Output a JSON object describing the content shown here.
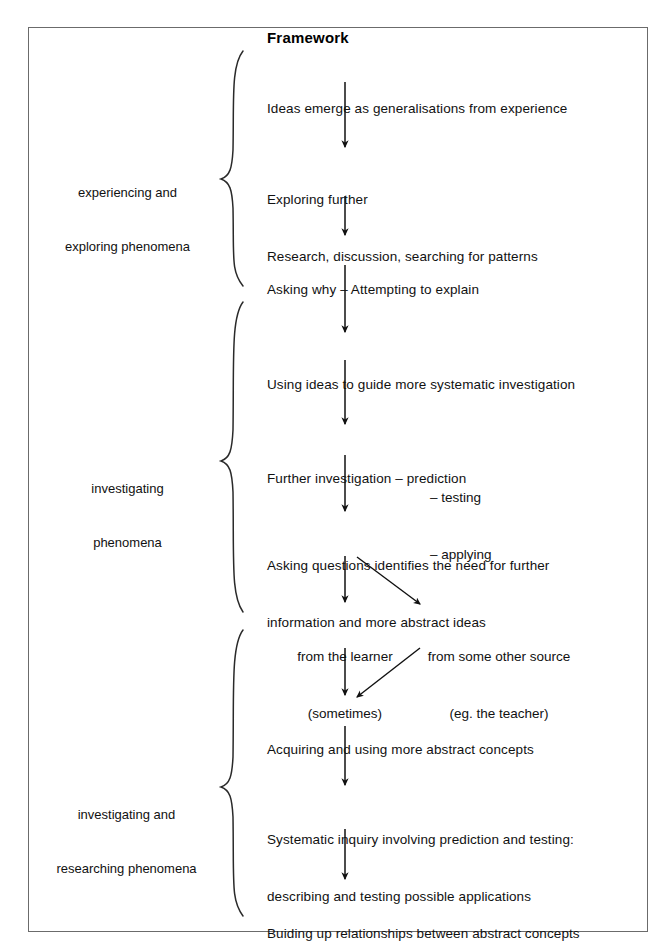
{
  "page": {
    "background": "#ffffff",
    "frame_border_color": "#6b6b6b",
    "ink_color": "#111111"
  },
  "diagram": {
    "title": "Framework",
    "stages": [
      {
        "id": "stage-1",
        "line1": "experiencing and",
        "line2": "exploring phenomena"
      },
      {
        "id": "stage-2",
        "line1": "investigating",
        "line2": "phenomena"
      },
      {
        "id": "stage-3",
        "line1": "investigating and",
        "line2": "researching phenomena"
      }
    ],
    "nodes": [
      {
        "id": "node-1",
        "line1": "Ideas emerge as generalisations from experience",
        "line2": ""
      },
      {
        "id": "node-2",
        "line1": "Exploring further",
        "line2": "Research, discussion, searching for patterns"
      },
      {
        "id": "node-3",
        "line1": "Asking why – Attempting to explain",
        "line2": ""
      },
      {
        "id": "node-4",
        "line1": "Using ideas to guide more systematic investigation",
        "line2": ""
      },
      {
        "id": "node-5",
        "line1": "Further investigation – prediction",
        "line2": ""
      },
      {
        "id": "node-6",
        "line1": "Asking questions identifies the need for further",
        "line2": "information and more abstract ideas"
      },
      {
        "id": "node-7",
        "line1": "Acquiring and using more abstract concepts",
        "line2": ""
      },
      {
        "id": "node-8",
        "line1": "Systematic inquiry involving prediction and testing:",
        "line2": "describing and testing possible applications"
      },
      {
        "id": "node-9",
        "line1": "Buiding up relationships between abstract concepts",
        "line2": ""
      }
    ],
    "node_5_sublist": [
      "– testing",
      "– applying"
    ],
    "branches": [
      {
        "id": "branch-learner",
        "line1": "from the learner",
        "line2": "(sometimes)"
      },
      {
        "id": "branch-other-source",
        "line1": "from some other source",
        "line2": "(eg. the teacher)"
      }
    ]
  }
}
